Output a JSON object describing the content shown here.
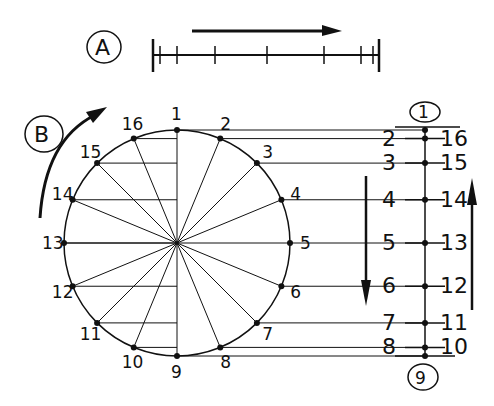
{
  "diagram": {
    "part_a": {
      "label": "A",
      "arrow_direction": "right",
      "tick_positions_x": [
        153,
        160,
        177,
        215,
        267,
        324,
        361,
        373,
        379
      ]
    },
    "part_b": {
      "label": "B",
      "arrow_direction": "clockwise",
      "circle": {
        "cx": 177,
        "cy": 243,
        "r": 113
      },
      "points": [
        "1",
        "2",
        "3",
        "4",
        "5",
        "6",
        "7",
        "8",
        "9",
        "10",
        "11",
        "12",
        "13",
        "14",
        "15",
        "16"
      ]
    },
    "scale": {
      "top_label": "1",
      "bottom_label": "9",
      "left_labels": [
        "2",
        "3",
        "4",
        "5",
        "6",
        "7",
        "8"
      ],
      "right_labels": [
        "16",
        "15",
        "14",
        "13",
        "12",
        "11",
        "10"
      ],
      "down_arrow": "down",
      "up_arrow": "up"
    },
    "color": "#111111"
  }
}
